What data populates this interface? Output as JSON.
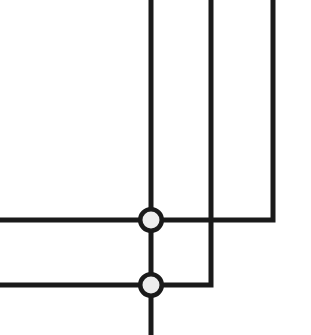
{
  "canvas": {
    "width": 311,
    "height": 335,
    "background_color": "#ffffff",
    "title": "Schematic line diagram with junction nodes"
  },
  "style": {
    "line_color": "#1a1a1a",
    "line_width": 5,
    "node_fill_color": "#ededed",
    "node_stroke_color": "#1a1a1a",
    "node_outer_radius": 13,
    "node_stroke_width": 4.5
  },
  "wires": [
    {
      "name": "vertical-line-left",
      "description": "Leftmost vertical line from top edge down through both junction nodes to bottom edge",
      "points": "151,0 151,335"
    },
    {
      "name": "vertical-line-middle",
      "description": "Middle vertical line from top edge down, crossing the upper horizontal line, elbow turning left into the lower horizontal line",
      "points": "211,0 211,285 151,285"
    },
    {
      "name": "vertical-line-right",
      "description": "Rightmost vertical line from top edge down, elbow turning left into the upper horizontal line",
      "points": "273,0 273,220 151,220"
    },
    {
      "name": "horizontal-line-upper",
      "description": "Upper horizontal line from left edge to the upper junction node",
      "points": "0,220 151,220"
    },
    {
      "name": "horizontal-line-lower",
      "description": "Lower horizontal line from left edge to the lower junction node",
      "points": "0,285 151,285"
    }
  ],
  "junction_nodes": [
    {
      "name": "junction-node-upper",
      "label": "upper junction",
      "cx": 151,
      "cy": 220,
      "connects": [
        "horizontal-line-upper",
        "vertical-line-left",
        "vertical-line-right"
      ]
    },
    {
      "name": "junction-node-lower",
      "label": "lower junction",
      "cx": 151,
      "cy": 285,
      "connects": [
        "horizontal-line-lower",
        "vertical-line-left",
        "vertical-line-middle"
      ]
    }
  ],
  "crossings": [
    {
      "name": "crossing-no-connection",
      "description": "Middle vertical line crosses the upper horizontal line with no electrical connection",
      "cx": 211,
      "cy": 220
    }
  ]
}
